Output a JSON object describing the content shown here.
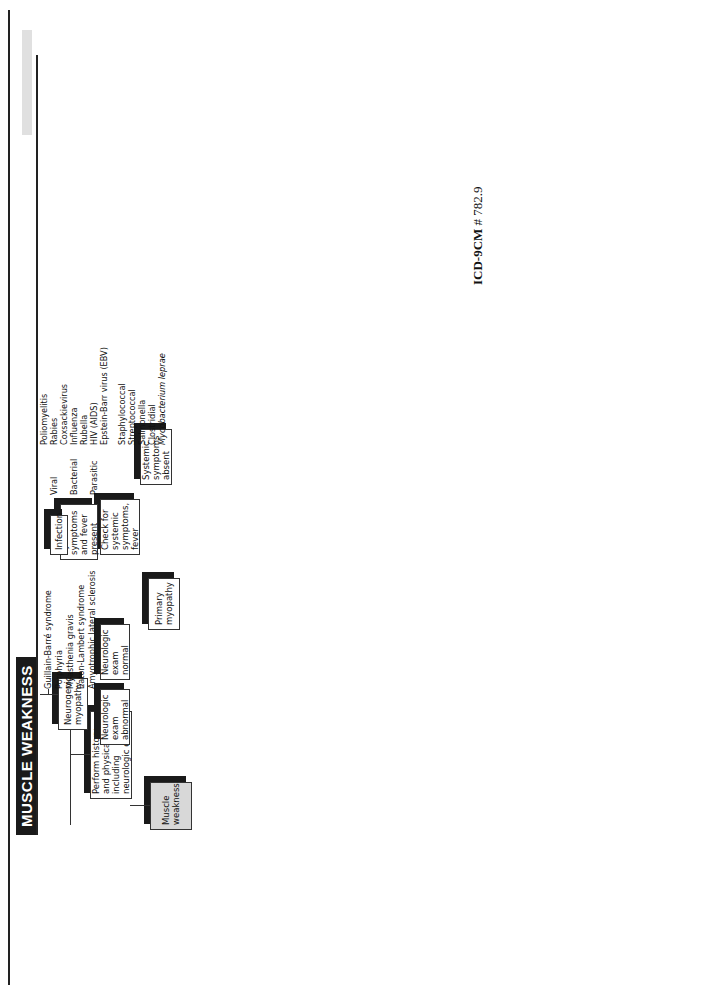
{
  "header": {
    "title": "MUSCLE WEAKNESS",
    "icd_label": "ICD-9CM",
    "icd_code": "# 782.9"
  },
  "nodes": {
    "start": "Muscle weakness",
    "history": "Perform history and physical, including neurologic exam",
    "neuro_abnormal": "Neurologic exam abnormal",
    "neuro_normal": "Neurologic exam normal",
    "neurogenic": "Neurogenic myopathy",
    "primary": "Primary myopathy",
    "check_systemic": "Check for systemic symptoms, fever",
    "systemic_present": "Systemic symptoms and fever present",
    "systemic_absent": "Systemic symptoms absent",
    "infection": "Infection",
    "check_serum": "Check serum glucose, electrolytes, Ca⁺⁺, Mg⁺, phosphate, FT₄I, TSH level, and myoglobinuria",
    "tests_abnormal": "Tests abnormal",
    "tests_normal": "Tests normal",
    "metabolic": "Metabolic abnormality",
    "measure_ck": "Measure serum creatine kinase (CK) and aldolase",
    "ck_elevated": "CK/aldolase elevated",
    "ck_normal": "CK/aldolase normal",
    "emg1": "Perform electromyography (EMG)",
    "emg1_abnormal": "EMG abnormal",
    "emg1_normal": "EMG normal",
    "biopsy": "Perform muscle biopsy",
    "biopsy_abnormal": "Muscle biopsy abnormal",
    "biopsy_normal": "Muscle biopsy normal",
    "sed_rate": "Measure sedimentation rate (M <5 mm/hr; F <12 mm/hr)",
    "sed_elevated": "Sed rate elevated",
    "sed_normal": "Sed rate normal",
    "emg2": "Perform electromyography (EMG)",
    "emg2_abnormal": "EMG abnormal",
    "emg2_normal": "EMG normal",
    "review_drug": "Review drug history",
    "positive_drug": "Positive drug history",
    "negative_drug": "Negative drug history",
    "emg3": "Perform electromyography (EMG)",
    "emg3_abnormal": "EMG abnormal",
    "emg3_normal": "EMG normal"
  },
  "lists": {
    "neurogenic": [
      "Guillain-Barré syndrome",
      "Porphyria",
      "Myasthenia gravis",
      "Eaton-Lambert syndrome",
      "Amyotrophic lateral sclerosis"
    ],
    "infection_types": [
      "Viral",
      "Bacterial",
      "Parasitic"
    ],
    "viral": [
      "Poliomyelitis",
      "Rabies",
      "Coxsackievirus",
      "Influenza",
      "Rubella",
      "HIV (AIDS)",
      "Epstein-Barr virus (EBV)"
    ],
    "bacterial": [
      "Staphylococcal",
      "Streptococcal",
      "Salmonella",
      "Clostridial",
      "Mycobacterium leprae"
    ],
    "metabolic": [
      "Familial periodic paralysis",
      "Diabetes mellitus",
      "Hypo/hyperthyroidism",
      "Hypo/hyperkalemia",
      "Hypercalcemia",
      "Hypermagnesemia",
      "Hypophosphatemia",
      "Hyperparathyroidism",
      "Vitamin D deficiency",
      "Renal tubular acidosis",
      "Cushing's syndrome",
      "Rhabdomyolysis",
      "McArdle's syndrome",
      "Familial myoglobinuria"
    ],
    "rhabdo": [
      "Progressive myopathy",
      "Seizures",
      "Hyperthermia",
      "Crush injury",
      "Extreme exertion",
      "Alcoholic myopathy"
    ],
    "emg1_abnormal": [
      "Polymyositis",
      "Dermatomyositis"
    ],
    "biopsy_abnormal": [
      "Muscular dystrophy",
      "Sarcoidosis"
    ],
    "biopsy_normal": [
      "Exercise-induced",
      "Sampling error"
    ],
    "emg2_abnormal": [
      "Rheumatoid arthritis",
      "Systemic lupus erythematosus",
      "Polyarteritis nodosa",
      "Dermatomyositis/polymyositis",
      "Amyloidosis",
      "Sarcoidosis"
    ],
    "emg2_normal": [
      "Polymyalgia rheumatica (PMR)"
    ],
    "drugs": [
      "Corticosteroids (steroid myopathy)",
      "D-penicillamine",
      "Colchicine",
      "Chloroquine",
      "Clofibrate",
      "Cimetidine",
      "Statins"
    ],
    "emg3_abnormal": [
      "Muscular dystrophies",
      "Congenital myopathies",
      "Amyloidosis",
      "Metabolic storage disease"
    ],
    "metabolic_storage": [
      "Adult acid maltase deficiency",
      "Carnitine deficiency"
    ],
    "emg3_normal": [
      "Endogenous depressive psychosis"
    ]
  },
  "caption": {
    "figure": "FIGURE 3-74",
    "title": "Muscle weakness.",
    "abbr1_term": "AIDS,",
    "abbr1_def": " Acquired immunodeficiency syndrome; ",
    "abbr2_term": "EBV,",
    "abbr2_def": " Epstein-Barr virus; ",
    "abbr3_term": "F,",
    "abbr3_def": " female; ",
    "abbr4_term": "HIV,",
    "abbr4_def": " human immunodeficiency virus; ",
    "abbr5_term": "M,",
    "abbr5_def": " male.",
    "source_pre": "(From Healey PM: ",
    "source_title": "Common medical diagnosis: an algorithmic approach,",
    "source_post": " ed 3, Philadelphia, 2000, WB Saunders.)"
  }
}
